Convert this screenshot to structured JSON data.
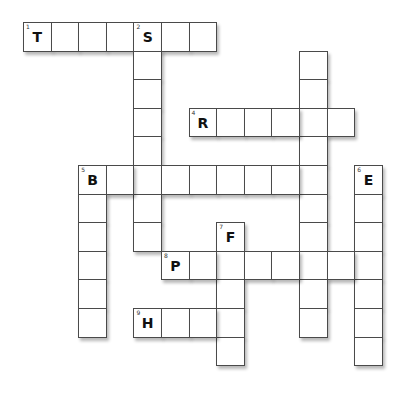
{
  "puzzle": {
    "type": "crossword",
    "grid": {
      "origin_x": 23,
      "origin_y": 22,
      "cell_w": 27.6,
      "cell_h": 28.6
    },
    "cells": [
      [
        0,
        0
      ],
      [
        0,
        1
      ],
      [
        0,
        2
      ],
      [
        0,
        3
      ],
      [
        0,
        4
      ],
      [
        0,
        5
      ],
      [
        0,
        6
      ],
      [
        1,
        4
      ],
      [
        2,
        4
      ],
      [
        3,
        4
      ],
      [
        4,
        4
      ],
      [
        5,
        4
      ],
      [
        6,
        4
      ],
      [
        7,
        4
      ],
      [
        1,
        10
      ],
      [
        2,
        10
      ],
      [
        3,
        10
      ],
      [
        4,
        10
      ],
      [
        5,
        10
      ],
      [
        6,
        10
      ],
      [
        7,
        10
      ],
      [
        8,
        10
      ],
      [
        9,
        10
      ],
      [
        10,
        10
      ],
      [
        3,
        6
      ],
      [
        3,
        7
      ],
      [
        3,
        8
      ],
      [
        3,
        9
      ],
      [
        3,
        11
      ],
      [
        5,
        2
      ],
      [
        5,
        3
      ],
      [
        5,
        5
      ],
      [
        5,
        6
      ],
      [
        5,
        7
      ],
      [
        5,
        8
      ],
      [
        5,
        9
      ],
      [
        6,
        2
      ],
      [
        7,
        2
      ],
      [
        8,
        2
      ],
      [
        9,
        2
      ],
      [
        10,
        2
      ],
      [
        5,
        12
      ],
      [
        6,
        12
      ],
      [
        7,
        12
      ],
      [
        8,
        12
      ],
      [
        9,
        12
      ],
      [
        10,
        12
      ],
      [
        11,
        12
      ],
      [
        7,
        7
      ],
      [
        8,
        7
      ],
      [
        9,
        7
      ],
      [
        10,
        7
      ],
      [
        11,
        7
      ],
      [
        8,
        5
      ],
      [
        8,
        6
      ],
      [
        8,
        8
      ],
      [
        8,
        9
      ],
      [
        8,
        11
      ],
      [
        10,
        4
      ],
      [
        10,
        5
      ],
      [
        10,
        6
      ]
    ],
    "clues": [
      {
        "number": "1",
        "direction": "across",
        "row": 0,
        "col": 0,
        "length": 7,
        "first_letter": "T"
      },
      {
        "number": "2",
        "direction": "down",
        "row": 0,
        "col": 4,
        "length": 8,
        "first_letter": "S"
      },
      {
        "number": "3",
        "direction": "down",
        "row": 0,
        "col": 10,
        "length": 11,
        "first_letter": "C"
      },
      {
        "number": "4",
        "direction": "across",
        "row": 3,
        "col": 6,
        "length": 6,
        "first_letter": "R"
      },
      {
        "number": "5",
        "direction": "across",
        "row": 5,
        "col": 2,
        "length": 9,
        "first_letter": "B"
      },
      {
        "number": "6",
        "direction": "down",
        "row": 5,
        "col": 12,
        "length": 7,
        "first_letter": "E"
      },
      {
        "number": "7",
        "direction": "down",
        "row": 7,
        "col": 7,
        "length": 5,
        "first_letter": "F"
      },
      {
        "number": "8",
        "direction": "across",
        "row": 8,
        "col": 5,
        "length": 8,
        "first_letter": "P"
      },
      {
        "number": "9",
        "direction": "across",
        "row": 10,
        "col": 4,
        "length": 4,
        "first_letter": "H"
      }
    ]
  }
}
